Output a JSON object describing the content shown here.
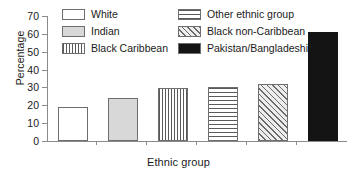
{
  "chart_data": {
    "type": "bar",
    "title": "",
    "xlabel": "Ethnic group",
    "ylabel": "Percentage",
    "categories": [
      "White",
      "Indian",
      "Black Caribbean",
      "Other ethnic group",
      "Black non-Caribbean",
      "Pakistan/Bangladeshi"
    ],
    "values": [
      19,
      24,
      29.5,
      30,
      32,
      61
    ],
    "ylim": [
      0,
      70
    ],
    "yticks": [
      0,
      10,
      20,
      30,
      40,
      50,
      60,
      70
    ],
    "ytick_labels": [
      "0",
      "10",
      "20",
      "30",
      "40",
      "50",
      "60",
      "70"
    ],
    "xtick_labels": [
      "",
      "",
      "",
      "",
      "",
      ""
    ],
    "grid": false,
    "legend_position": "top",
    "series": [
      {
        "name": "Percentage",
        "values": [
          19,
          24,
          29.5,
          30,
          32,
          61
        ]
      }
    ],
    "legend": [
      {
        "label": "White",
        "pattern": "empty",
        "color": "#ffffff"
      },
      {
        "label": "Other ethnic group",
        "pattern": "horizontal",
        "color": "#5a5a5a"
      },
      {
        "label": "Indian",
        "pattern": "solid-light",
        "color": "#d8d8d8"
      },
      {
        "label": "Black non-Caribbean",
        "pattern": "diagonal",
        "color": "#6a6a6a"
      },
      {
        "label": "Black Caribbean",
        "pattern": "vertical",
        "color": "#5a5a5a"
      },
      {
        "label": "Pakistan/Bangladeshi",
        "pattern": "black",
        "color": "#141414"
      }
    ]
  },
  "axis": {
    "y_label": "Percentage",
    "x_label": "Ethnic group",
    "tick_0": "0",
    "tick_10": "10",
    "tick_20": "20",
    "tick_30": "30",
    "tick_40": "40",
    "tick_50": "50",
    "tick_60": "60",
    "tick_70": "70"
  },
  "legend_labels": {
    "white": "White",
    "indian": "Indian",
    "black_caribbean": "Black Caribbean",
    "other_ethnic_group": "Other ethnic group",
    "black_non_caribbean": "Black non-Caribbean",
    "pakistan_bangladeshi": "Pakistan/Bangladeshi"
  },
  "colors": {
    "axis": "#8a8a8a",
    "bar_outline": "#6e6e6e",
    "text": "#1a1a1a",
    "black_fill": "#141414",
    "light_fill": "#d8d8d8",
    "background": "#ffffff"
  }
}
